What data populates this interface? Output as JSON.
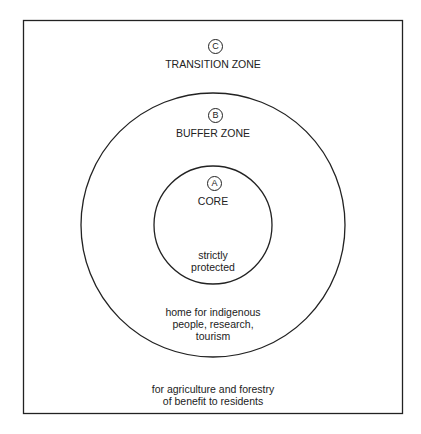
{
  "diagram": {
    "zones": [
      {
        "id": "C",
        "name": "TRANSITION ZONE",
        "description": [
          "for agriculture and forestry",
          "of benefit to residents"
        ]
      },
      {
        "id": "B",
        "name": "BUFFER ZONE",
        "description": [
          "home for indigenous",
          "people, research,",
          "tourism"
        ]
      },
      {
        "id": "A",
        "name": "CORE",
        "description": [
          "strictly",
          "protected"
        ]
      }
    ],
    "colors": {
      "line": "#222222",
      "background": "#ffffff"
    }
  }
}
